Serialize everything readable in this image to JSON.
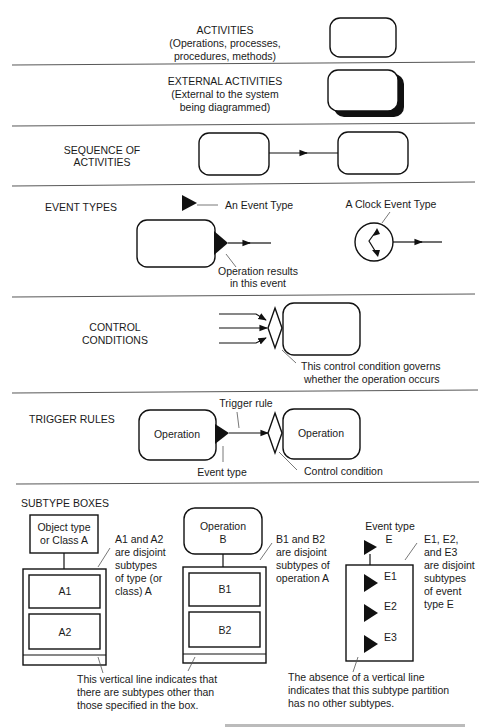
{
  "sections": {
    "activities": {
      "title": "ACTIVITIES",
      "subtitle_lines": [
        "(Operations, processes,",
        "procedures, methods)"
      ]
    },
    "external_activities": {
      "title": "EXTERNAL ACTIVITIES",
      "subtitle_lines": [
        "(External to the system",
        "being diagrammed)"
      ]
    },
    "sequence": {
      "title_lines": [
        "SEQUENCE OF",
        "ACTIVITIES"
      ]
    },
    "event_types": {
      "title": "EVENT TYPES",
      "event_type_label": "An Event Type",
      "clock_label": "A Clock Event Type",
      "result_label_lines": [
        "Operation results",
        "in this event"
      ]
    },
    "control_conditions": {
      "title_lines": [
        "CONTROL",
        "CONDITIONS"
      ],
      "note_lines": [
        "This control condition governs",
        "whether the operation occurs"
      ]
    },
    "trigger_rules": {
      "title": "TRIGGER RULES",
      "trigger_rule_label": "Trigger rule",
      "left_op": "Operation",
      "right_op": "Operation",
      "event_type_label": "Event type",
      "control_condition_label": "Control condition"
    },
    "subtype_boxes": {
      "title": "SUBTYPE BOXES",
      "object_box": {
        "parent_lines": [
          "Object type",
          "or Class A"
        ],
        "subtypes": [
          "A1",
          "A2"
        ],
        "note_lines": [
          "A1 and A2",
          "are disjoint",
          "subtypes",
          "of type (or",
          "class) A"
        ]
      },
      "operation_box": {
        "parent_lines": [
          "Operation",
          "B"
        ],
        "subtypes": [
          "B1",
          "B2"
        ],
        "note_lines": [
          "B1 and B2",
          "are disjoint",
          "subtypes of",
          "operation A"
        ]
      },
      "event_box": {
        "parent_lines": [
          "Event type",
          "E"
        ],
        "subtypes": [
          "E1",
          "E2",
          "E3"
        ],
        "note_lines": [
          "E1, E2,",
          "and E3",
          "are disjoint",
          "subtypes",
          "of event",
          "type E"
        ]
      },
      "vertical_line_note_lines": [
        "This vertical line indicates that",
        "there are subtypes other than",
        "those specified in the box."
      ],
      "absence_note_lines": [
        "The absence of a vertical line",
        "indicates that this subtype partition",
        "has no other subtypes."
      ]
    }
  }
}
